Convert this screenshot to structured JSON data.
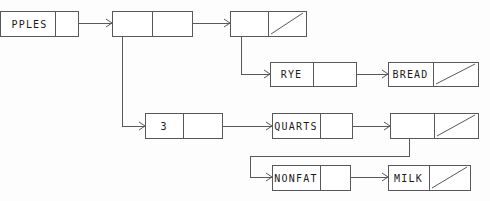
{
  "diagram": {
    "colors": {
      "stroke": "#55595c",
      "text": "#1a1a1a",
      "background": "#fdfdfd",
      "box_fill": "#ffffff"
    },
    "nodes": [
      {
        "id": "node-apples",
        "name": "node-apples",
        "left_label": "PPLES",
        "right_label": "",
        "right_is_null": false,
        "x": 0,
        "y": 11,
        "w": 78,
        "h": 25,
        "split": 55,
        "clipped_left": true
      },
      {
        "id": "node-head",
        "name": "node-head",
        "left_label": "",
        "right_label": "",
        "right_is_null": false,
        "x": 112,
        "y": 11,
        "w": 80,
        "h": 25,
        "split": 40
      },
      {
        "id": "node-second",
        "name": "node-second",
        "left_label": "",
        "right_label": "",
        "right_is_null": true,
        "x": 230,
        "y": 11,
        "w": 76,
        "h": 25,
        "split": 38
      },
      {
        "id": "node-rye",
        "name": "node-rye",
        "left_label": "RYE",
        "right_label": "",
        "right_is_null": false,
        "x": 270,
        "y": 62,
        "w": 86,
        "h": 24,
        "split": 43
      },
      {
        "id": "node-bread",
        "name": "node-bread",
        "left_label": "BREAD",
        "right_label": "",
        "right_is_null": true,
        "x": 388,
        "y": 62,
        "w": 90,
        "h": 24,
        "split": 45
      },
      {
        "id": "node-three",
        "name": "node-three",
        "left_label": "3",
        "right_label": "",
        "right_is_null": false,
        "x": 145,
        "y": 113,
        "w": 77,
        "h": 25,
        "split": 38
      },
      {
        "id": "node-quarts",
        "name": "node-quarts",
        "left_label": "QUARTS",
        "right_label": "",
        "right_is_null": false,
        "x": 272,
        "y": 113,
        "w": 80,
        "h": 25,
        "split": 48
      },
      {
        "id": "node-milk-parent",
        "name": "node-milk-parent",
        "left_label": "",
        "right_label": "",
        "right_is_null": true,
        "x": 390,
        "y": 113,
        "w": 88,
        "h": 25,
        "split": 44
      },
      {
        "id": "node-nonfat",
        "name": "node-nonfat",
        "left_label": "NONFAT",
        "right_label": "",
        "right_is_null": false,
        "x": 272,
        "y": 165,
        "w": 78,
        "h": 25,
        "split": 48
      },
      {
        "id": "node-milk",
        "name": "node-milk",
        "left_label": "MILK",
        "right_label": "",
        "right_is_null": true,
        "x": 388,
        "y": 165,
        "w": 82,
        "h": 25,
        "split": 41
      }
    ],
    "connectors": [
      {
        "name": "connector-apples-to-head",
        "points": "78,23 112,23",
        "arrow_at": "112,23"
      },
      {
        "name": "connector-head-to-second",
        "points": "192,23 230,23",
        "arrow_at": "230,23"
      },
      {
        "name": "connector-head-down-to-three",
        "points": "122,36 122,126 145,126",
        "arrow_at": "145,126"
      },
      {
        "name": "connector-second-down-to-rye",
        "points": "241,36 241,74 270,74",
        "arrow_at": "270,74"
      },
      {
        "name": "connector-rye-to-bread",
        "points": "356,74 388,74",
        "arrow_at": "388,74"
      },
      {
        "name": "connector-three-to-quarts",
        "points": "222,126 272,126",
        "arrow_at": "272,126"
      },
      {
        "name": "connector-quarts-to-parent",
        "points": "352,126 390,126",
        "arrow_at": "390,126"
      },
      {
        "name": "connector-parent-down-to-nonfat",
        "points": "409,138 409,156 250,156 250,177 272,177",
        "arrow_at": "272,177"
      },
      {
        "name": "connector-nonfat-to-milk",
        "points": "350,177 388,177",
        "arrow_at": "388,177"
      }
    ]
  }
}
